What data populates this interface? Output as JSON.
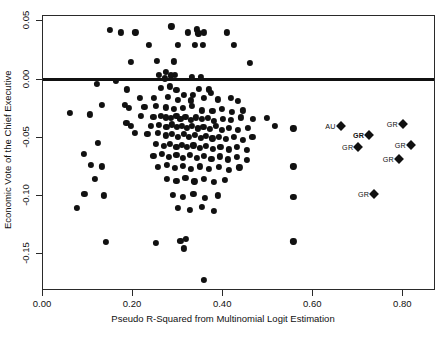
{
  "chart_data": {
    "type": "scatter",
    "title": "",
    "xlabel": "Pseudo R-Squared from Multinomial Logit Estimation",
    "ylabel": "Economic Vote of the Chief Executive",
    "xlim": [
      -0.0,
      0.8725
    ],
    "ylim": [
      -0.1815,
      0.0545
    ],
    "xticks": [
      0.0,
      0.2,
      0.4,
      0.6,
      0.8
    ],
    "xticklabels": [
      "0.00",
      "0.20",
      "0.40",
      "0.60",
      "0.80"
    ],
    "yticks": [
      0.05,
      0.0,
      -0.05,
      -0.1,
      -0.15
    ],
    "yticklabels": [
      "0.05",
      "0.00",
      "-0.05",
      "-0.10",
      "-0.15"
    ],
    "grid": false,
    "legend": "none",
    "reference_lines": [
      {
        "orientation": "horizontal",
        "y": 0.0
      }
    ],
    "series": [
      {
        "name": "countries",
        "marker": "circle",
        "color": "#111111",
        "points": [
          [
            0.148,
            0.0425
          ],
          [
            0.173,
            0.0405
          ],
          [
            0.205,
            0.0405
          ],
          [
            0.285,
            0.0455
          ],
          [
            0.322,
            0.0405
          ],
          [
            0.342,
            0.043
          ],
          [
            0.345,
            0.0395
          ],
          [
            0.357,
            0.0405
          ],
          [
            0.408,
            0.0405
          ],
          [
            0.236,
            0.03
          ],
          [
            0.3,
            0.0295
          ],
          [
            0.355,
            0.0295
          ],
          [
            0.424,
            0.0295
          ],
          [
            0.195,
            0.015
          ],
          [
            0.253,
            0.016
          ],
          [
            0.29,
            0.0155
          ],
          [
            0.338,
            0.0295
          ],
          [
            0.46,
            0.0145
          ],
          [
            0.272,
            0.0065
          ],
          [
            0.292,
            0.004
          ],
          [
            0.284,
            0.0035
          ],
          [
            0.33,
            0.002
          ],
          [
            0.35,
            0.002
          ],
          [
            0.27,
            0.001
          ],
          [
            0.258,
            0.004
          ],
          [
            0.162,
            -0.0015
          ],
          [
            0.12,
            -0.004
          ],
          [
            0.186,
            -0.0085
          ],
          [
            0.261,
            -0.007
          ],
          [
            0.281,
            -0.006
          ],
          [
            0.296,
            -0.009
          ],
          [
            0.347,
            -0.008
          ],
          [
            0.368,
            -0.0085
          ],
          [
            0.372,
            -0.0115
          ],
          [
            0.312,
            -0.013
          ],
          [
            0.332,
            -0.013
          ],
          [
            0.215,
            -0.016
          ],
          [
            0.246,
            -0.0155
          ],
          [
            0.278,
            -0.015
          ],
          [
            0.3,
            -0.0175
          ],
          [
            0.328,
            -0.018
          ],
          [
            0.358,
            -0.016
          ],
          [
            0.388,
            -0.017
          ],
          [
            0.418,
            -0.0155
          ],
          [
            0.432,
            -0.0185
          ],
          [
            0.13,
            -0.0215
          ],
          [
            0.182,
            -0.0215
          ],
          [
            0.19,
            -0.0245
          ],
          [
            0.225,
            -0.0235
          ],
          [
            0.25,
            -0.0225
          ],
          [
            0.272,
            -0.024
          ],
          [
            0.29,
            -0.025
          ],
          [
            0.31,
            -0.0245
          ],
          [
            0.33,
            -0.023
          ],
          [
            0.352,
            -0.0265
          ],
          [
            0.376,
            -0.027
          ],
          [
            0.398,
            -0.0255
          ],
          [
            0.42,
            -0.0275
          ],
          [
            0.444,
            -0.0265
          ],
          [
            0.06,
            -0.029
          ],
          [
            0.105,
            -0.03
          ],
          [
            0.218,
            -0.031
          ],
          [
            0.245,
            -0.032
          ],
          [
            0.262,
            -0.0315
          ],
          [
            0.272,
            -0.0325
          ],
          [
            0.284,
            -0.033
          ],
          [
            0.296,
            -0.0315
          ],
          [
            0.305,
            -0.0335
          ],
          [
            0.316,
            -0.032
          ],
          [
            0.328,
            -0.0345
          ],
          [
            0.34,
            -0.0325
          ],
          [
            0.352,
            -0.034
          ],
          [
            0.366,
            -0.033
          ],
          [
            0.38,
            -0.0355
          ],
          [
            0.4,
            -0.034
          ],
          [
            0.418,
            -0.035
          ],
          [
            0.44,
            -0.0325
          ],
          [
            0.466,
            -0.034
          ],
          [
            0.497,
            -0.033
          ],
          [
            0.185,
            -0.0375
          ],
          [
            0.196,
            -0.0395
          ],
          [
            0.24,
            -0.04
          ],
          [
            0.258,
            -0.039
          ],
          [
            0.274,
            -0.0405
          ],
          [
            0.286,
            -0.0385
          ],
          [
            0.298,
            -0.041
          ],
          [
            0.309,
            -0.0395
          ],
          [
            0.32,
            -0.0415
          ],
          [
            0.331,
            -0.04
          ],
          [
            0.344,
            -0.042
          ],
          [
            0.356,
            -0.0405
          ],
          [
            0.37,
            -0.0425
          ],
          [
            0.384,
            -0.04
          ],
          [
            0.398,
            -0.043
          ],
          [
            0.412,
            -0.0415
          ],
          [
            0.432,
            -0.043
          ],
          [
            0.455,
            -0.0415
          ],
          [
            0.515,
            -0.0395
          ],
          [
            0.556,
            -0.042
          ],
          [
            0.204,
            -0.0455
          ],
          [
            0.232,
            -0.047
          ],
          [
            0.255,
            -0.046
          ],
          [
            0.272,
            -0.048
          ],
          [
            0.286,
            -0.0465
          ],
          [
            0.3,
            -0.049
          ],
          [
            0.312,
            -0.047
          ],
          [
            0.324,
            -0.0495
          ],
          [
            0.338,
            -0.0475
          ],
          [
            0.35,
            -0.05
          ],
          [
            0.362,
            -0.0485
          ],
          [
            0.376,
            -0.0505
          ],
          [
            0.39,
            -0.049
          ],
          [
            0.406,
            -0.051
          ],
          [
            0.424,
            -0.0495
          ],
          [
            0.444,
            -0.0515
          ],
          [
            0.465,
            -0.049
          ],
          [
            0.122,
            -0.0545
          ],
          [
            0.25,
            -0.0555
          ],
          [
            0.268,
            -0.057
          ],
          [
            0.282,
            -0.055
          ],
          [
            0.296,
            -0.0575
          ],
          [
            0.308,
            -0.056
          ],
          [
            0.32,
            -0.058
          ],
          [
            0.334,
            -0.0565
          ],
          [
            0.348,
            -0.059
          ],
          [
            0.362,
            -0.057
          ],
          [
            0.378,
            -0.0595
          ],
          [
            0.394,
            -0.0575
          ],
          [
            0.412,
            -0.06
          ],
          [
            0.43,
            -0.058
          ],
          [
            0.452,
            -0.0605
          ],
          [
            0.09,
            -0.064
          ],
          [
            0.245,
            -0.0655
          ],
          [
            0.264,
            -0.064
          ],
          [
            0.28,
            -0.0665
          ],
          [
            0.296,
            -0.0645
          ],
          [
            0.31,
            -0.067
          ],
          [
            0.326,
            -0.065
          ],
          [
            0.342,
            -0.0675
          ],
          [
            0.358,
            -0.0655
          ],
          [
            0.374,
            -0.068
          ],
          [
            0.392,
            -0.066
          ],
          [
            0.41,
            -0.0685
          ],
          [
            0.43,
            -0.0665
          ],
          [
            0.452,
            -0.069
          ],
          [
            0.106,
            -0.0735
          ],
          [
            0.13,
            -0.0745
          ],
          [
            0.255,
            -0.075
          ],
          [
            0.275,
            -0.0735
          ],
          [
            0.292,
            -0.076
          ],
          [
            0.31,
            -0.074
          ],
          [
            0.328,
            -0.0765
          ],
          [
            0.348,
            -0.0745
          ],
          [
            0.368,
            -0.077
          ],
          [
            0.39,
            -0.075
          ],
          [
            0.412,
            -0.0775
          ],
          [
            0.436,
            -0.0755
          ],
          [
            0.556,
            -0.0745
          ],
          [
            0.115,
            -0.0855
          ],
          [
            0.275,
            -0.085
          ],
          [
            0.296,
            -0.087
          ],
          [
            0.316,
            -0.0845
          ],
          [
            0.336,
            -0.0875
          ],
          [
            0.358,
            -0.0855
          ],
          [
            0.38,
            -0.088
          ],
          [
            0.404,
            -0.086
          ],
          [
            0.092,
            -0.0985
          ],
          [
            0.136,
            -0.0995
          ],
          [
            0.288,
            -0.099
          ],
          [
            0.31,
            -0.101
          ],
          [
            0.334,
            -0.0985
          ],
          [
            0.36,
            -0.1015
          ],
          [
            0.388,
            -0.0995
          ],
          [
            0.556,
            -0.1005
          ],
          [
            0.076,
            -0.1105
          ],
          [
            0.3,
            -0.11
          ],
          [
            0.326,
            -0.112
          ],
          [
            0.352,
            -0.1095
          ],
          [
            0.38,
            -0.1125
          ],
          [
            0.14,
            -0.1395
          ],
          [
            0.25,
            -0.1405
          ],
          [
            0.305,
            -0.1385
          ],
          [
            0.318,
            -0.137
          ],
          [
            0.312,
            -0.145
          ],
          [
            0.556,
            -0.139
          ],
          [
            0.358,
            -0.172
          ]
        ]
      },
      {
        "name": "labeled-countries",
        "marker": "diamond",
        "color": "#111111",
        "points": [
          {
            "x": 0.661,
            "y": -0.04,
            "label": "AU",
            "bold": false
          },
          {
            "x": 0.799,
            "y": -0.038,
            "label": "GR",
            "bold": false
          },
          {
            "x": 0.724,
            "y": -0.048,
            "label": "GR",
            "bold": true
          },
          {
            "x": 0.7,
            "y": -0.0575,
            "label": "GR",
            "bold": false
          },
          {
            "x": 0.817,
            "y": -0.0565,
            "label": "GR",
            "bold": false
          },
          {
            "x": 0.79,
            "y": -0.0685,
            "label": "GR",
            "bold": false
          },
          {
            "x": 0.735,
            "y": -0.0985,
            "label": "GR",
            "bold": false
          }
        ]
      }
    ]
  }
}
